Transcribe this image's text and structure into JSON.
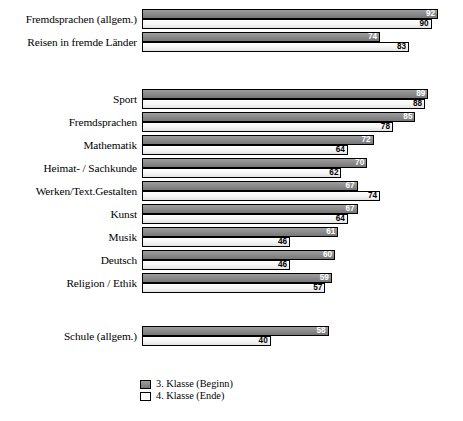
{
  "chart_data": {
    "type": "bar",
    "orientation": "horizontal",
    "title": "",
    "xlabel": "",
    "ylabel": "",
    "xlim": [
      0,
      92
    ],
    "grid": false,
    "legend_position": "bottom-left",
    "categories": [
      "Fremdsprachen (allgem.)",
      "Reisen in fremde Länder",
      "Sport",
      "Fremdsprachen",
      "Mathematik",
      "Heimat- / Sachkunde",
      "Werken/Text.Gestalten",
      "Kunst",
      "Musik",
      "Deutsch",
      "Religion / Ethik",
      "Schule (allgem.)"
    ],
    "series": [
      {
        "name": "3. Klasse (Beginn)",
        "color": "#8c8c8c",
        "values": [
          92,
          74,
          89,
          85,
          72,
          70,
          67,
          67,
          61,
          60,
          59,
          58
        ]
      },
      {
        "name": "4. Klasse (Ende)",
        "color": "#ffffff",
        "values": [
          90,
          83,
          88,
          78,
          64,
          62,
          74,
          64,
          46,
          46,
          57,
          40
        ]
      }
    ]
  },
  "groups": [
    {
      "name": "group-interests",
      "rows": [
        {
          "label": "Fremdsprachen (allgem.)",
          "begin": {
            "value": 92,
            "label": "92"
          },
          "end": {
            "value": 90,
            "label": "90"
          }
        },
        {
          "label": "Reisen in fremde Länder",
          "begin": {
            "value": 74,
            "label": "74"
          },
          "end": {
            "value": 83,
            "label": "83"
          }
        }
      ]
    },
    {
      "name": "group-subjects",
      "rows": [
        {
          "label": "Sport",
          "begin": {
            "value": 89,
            "label": "89"
          },
          "end": {
            "value": 88,
            "label": "88"
          }
        },
        {
          "label": "Fremdsprachen",
          "begin": {
            "value": 85,
            "label": "85"
          },
          "end": {
            "value": 78,
            "label": "78"
          }
        },
        {
          "label": "Mathematik",
          "begin": {
            "value": 72,
            "label": "72"
          },
          "end": {
            "value": 64,
            "label": "64"
          }
        },
        {
          "label": "Heimat- / Sachkunde",
          "begin": {
            "value": 70,
            "label": "70"
          },
          "end": {
            "value": 62,
            "label": "62"
          }
        },
        {
          "label": "Werken/Text.Gestalten",
          "begin": {
            "value": 67,
            "label": "67"
          },
          "end": {
            "value": 74,
            "label": "74"
          }
        },
        {
          "label": "Kunst",
          "begin": {
            "value": 67,
            "label": "67"
          },
          "end": {
            "value": 64,
            "label": "64"
          }
        },
        {
          "label": "Musik",
          "begin": {
            "value": 61,
            "label": "61"
          },
          "end": {
            "value": 46,
            "label": "46"
          }
        },
        {
          "label": "Deutsch",
          "begin": {
            "value": 60,
            "label": "60"
          },
          "end": {
            "value": 46,
            "label": "46"
          }
        },
        {
          "label": "Religion / Ethik",
          "begin": {
            "value": 59,
            "label": "59"
          },
          "end": {
            "value": 57,
            "label": "57"
          }
        }
      ]
    },
    {
      "name": "group-school",
      "rows": [
        {
          "label": "Schule (allgem.)",
          "begin": {
            "value": 58,
            "label": "58"
          },
          "end": {
            "value": 40,
            "label": "40"
          }
        }
      ]
    }
  ],
  "legend": {
    "items": [
      {
        "label": "3. Klasse (Beginn)",
        "swatch": "begin"
      },
      {
        "label": "4. Klasse (Ende)",
        "swatch": "end"
      }
    ]
  }
}
